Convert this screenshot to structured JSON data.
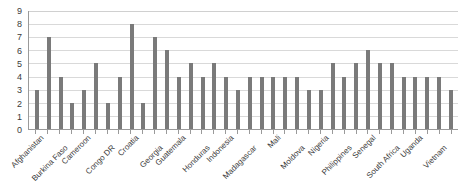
{
  "chart_data": {
    "type": "bar",
    "title": "",
    "subtitle": "",
    "xlabel": "",
    "ylabel": "",
    "ylim": [
      0,
      9
    ],
    "ytick_labels": [
      "0",
      "1",
      "2",
      "3",
      "4",
      "5",
      "6",
      "7",
      "8",
      "9"
    ],
    "ytick_values": [
      0,
      1,
      2,
      3,
      4,
      5,
      6,
      7,
      8,
      9
    ],
    "grid": true,
    "legend": false,
    "legend_position": "none",
    "bar_color": "#7a7a7a",
    "gridline_color": "#d9d9d9",
    "axis_color": "#9a9a9a",
    "n_bars": 36,
    "categories": [
      "Afghanistan",
      "",
      "Burkina Faso",
      "",
      "Cameroon",
      "",
      "Congo DR",
      "",
      "Croatia",
      "",
      "Georgia",
      "",
      "Guatemala",
      "",
      "Honduras",
      "",
      "Indonesia",
      "",
      "Madagascar",
      "",
      "Mali",
      "",
      "Moldova",
      "",
      "Nigeria",
      "",
      "Philippines",
      "",
      "Senegal",
      "",
      "South Africa",
      "",
      "Uganda",
      "",
      "Vietnam",
      ""
    ],
    "labeled_categories": [
      "Afghanistan",
      "Burkina Faso",
      "Cameroon",
      "Congo DR",
      "Croatia",
      "Georgia",
      "Guatemala",
      "Honduras",
      "Indonesia",
      "Madagascar",
      "Mali",
      "Moldova",
      "Nigeria",
      "Philippines",
      "Senegal",
      "South Africa",
      "Uganda",
      "Vietnam"
    ],
    "values": [
      3,
      7,
      4,
      2,
      3,
      5,
      2,
      4,
      8,
      2,
      7,
      6,
      4,
      5,
      4,
      5,
      4,
      3,
      4,
      4,
      4,
      4,
      4,
      3,
      3,
      5,
      4,
      5,
      6,
      5,
      5,
      4,
      4,
      4,
      4,
      3
    ]
  }
}
